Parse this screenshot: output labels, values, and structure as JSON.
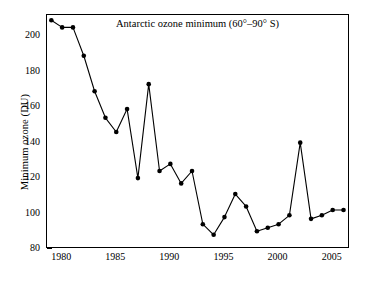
{
  "chart_data": {
    "type": "line",
    "title": "Antarctic ozone minimum (60°–90° S)",
    "xlabel": "",
    "ylabel": "Minimum ozone (DU)",
    "xlim": [
      1978.6,
      2006.6
    ],
    "ylim": [
      80,
      212
    ],
    "xticks": [
      1980,
      1985,
      1990,
      1995,
      2000,
      2005
    ],
    "xticklabels": [
      "1980",
      "1985",
      "1990",
      "1995",
      "2000",
      "2005"
    ],
    "yticks": [
      80,
      100,
      120,
      140,
      160,
      180,
      200
    ],
    "yticklabels": [
      "80",
      "100",
      "120",
      "140",
      "160",
      "180",
      "200"
    ],
    "grid": false,
    "legend": null,
    "marker": "filled-circle",
    "line_color": "#000000",
    "marker_color": "#000000",
    "x": [
      1979,
      1980,
      1981,
      1982,
      1983,
      1984,
      1985,
      1986,
      1987,
      1988,
      1989,
      1990,
      1991,
      1992,
      1993,
      1994,
      1995,
      1996,
      1997,
      1998,
      1999,
      2000,
      2001,
      2002,
      2003,
      2004,
      2005,
      2006
    ],
    "values": [
      209,
      205,
      205,
      189,
      169,
      154,
      146,
      159,
      120,
      173,
      124,
      128,
      117,
      124,
      94,
      88,
      98,
      111,
      104,
      90,
      92,
      94,
      99,
      140,
      97,
      99,
      102,
      102
    ],
    "series": [
      {
        "name": "Antarctic ozone minimum",
        "x": [
          1979,
          1980,
          1981,
          1982,
          1983,
          1984,
          1985,
          1986,
          1987,
          1988,
          1989,
          1990,
          1991,
          1992,
          1993,
          1994,
          1995,
          1996,
          1997,
          1998,
          1999,
          2000,
          2001,
          2002,
          2003,
          2004,
          2005,
          2006
        ],
        "values": [
          209,
          205,
          205,
          189,
          169,
          154,
          146,
          159,
          120,
          173,
          124,
          128,
          117,
          124,
          94,
          88,
          98,
          111,
          104,
          90,
          92,
          94,
          99,
          140,
          97,
          99,
          102,
          102
        ]
      }
    ],
    "annotations": []
  }
}
